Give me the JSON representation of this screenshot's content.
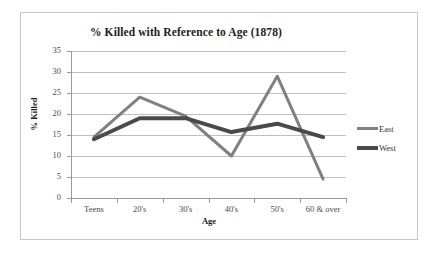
{
  "chart_data": {
    "type": "line",
    "title": "% Killed with Reference to Age (1878)",
    "xlabel": "Age",
    "ylabel": "% Killed",
    "categories": [
      "Teens",
      "20's",
      "30's",
      "40's",
      "50's",
      "60 & over"
    ],
    "series": [
      {
        "name": "East",
        "values": [
          14.5,
          24,
          19.5,
          10,
          29,
          4.5
        ],
        "color": "#808080"
      },
      {
        "name": "West",
        "values": [
          14,
          19,
          19,
          15.7,
          17.7,
          14.5
        ],
        "color": "#4a4a4a"
      }
    ],
    "ylim": [
      0,
      35
    ],
    "ytick_step": 5,
    "yticks": [
      "35",
      "30",
      "25",
      "20",
      "15",
      "10",
      "5",
      "0"
    ],
    "grid": "horizontal",
    "legend_position": "right"
  },
  "legend": {
    "items": [
      {
        "label": "East"
      },
      {
        "label": "West"
      }
    ]
  }
}
